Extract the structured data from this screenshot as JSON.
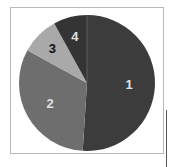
{
  "chart_data": {
    "type": "pie",
    "title": "",
    "categories": [
      "1",
      "2",
      "3",
      "4"
    ],
    "values": [
      51,
      32,
      9,
      8
    ],
    "colors": [
      "#3c3c3c",
      "#6e6e6e",
      "#a9a9a9",
      "#343434"
    ],
    "label_colors": [
      "#e0e0e0",
      "#e0e0e0",
      "#111111",
      "#e0e0e0"
    ],
    "start_angle_deg": 0,
    "direction": "clockwise",
    "legend": "none",
    "labels_inside": true
  }
}
